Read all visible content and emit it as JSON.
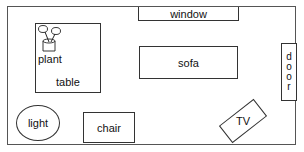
{
  "diagram": {
    "type": "room-floor-plan",
    "items": {
      "window": "window",
      "sofa": "sofa",
      "door_letters": [
        "d",
        "o",
        "o",
        "r"
      ],
      "plant": "plant",
      "table": "table",
      "light": "light",
      "chair": "chair",
      "tv": "TV"
    }
  }
}
